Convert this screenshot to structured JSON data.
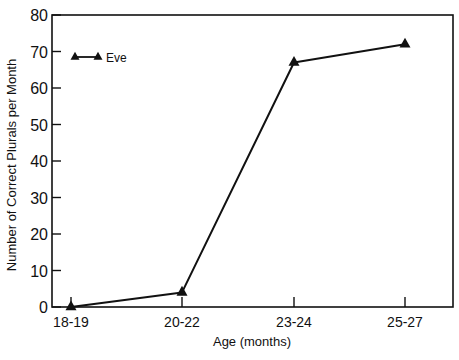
{
  "chart_data": {
    "type": "line",
    "title": "",
    "xlabel": "Age (months)",
    "ylabel": "Number of Correct Plurals per Month",
    "categories": [
      "18-19",
      "20-22",
      "23-24",
      "25-27"
    ],
    "series": [
      {
        "name": "Eve",
        "marker": "triangle",
        "color": "#111111",
        "values": [
          0,
          4,
          67,
          72
        ]
      }
    ],
    "ylim": [
      0,
      80
    ],
    "yticks": [
      0,
      10,
      20,
      30,
      40,
      50,
      60,
      70,
      80
    ],
    "grid": false,
    "legend_position": "upper-left"
  },
  "labels": {
    "xlabel": "Age (months)",
    "ylabel": "Number of Correct Plurals per Month",
    "legend": "Eve"
  },
  "colors": {
    "ink": "#111111",
    "background": "#ffffff"
  }
}
